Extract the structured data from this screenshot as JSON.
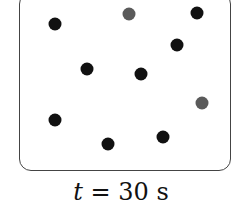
{
  "diagram": {
    "label_var": "t",
    "label_eq": " = 30 s",
    "colors": {
      "black": "#111111",
      "gray": "#5a5a5a"
    },
    "particles": [
      {
        "x": 55,
        "y": 24,
        "color": "black"
      },
      {
        "x": 129,
        "y": 14,
        "color": "gray"
      },
      {
        "x": 197,
        "y": 13,
        "color": "black"
      },
      {
        "x": 177,
        "y": 45,
        "color": "black"
      },
      {
        "x": 87,
        "y": 69,
        "color": "black"
      },
      {
        "x": 141,
        "y": 74,
        "color": "black"
      },
      {
        "x": 202,
        "y": 103,
        "color": "gray"
      },
      {
        "x": 55,
        "y": 120,
        "color": "black"
      },
      {
        "x": 108,
        "y": 144,
        "color": "black"
      },
      {
        "x": 163,
        "y": 137,
        "color": "black"
      }
    ]
  }
}
